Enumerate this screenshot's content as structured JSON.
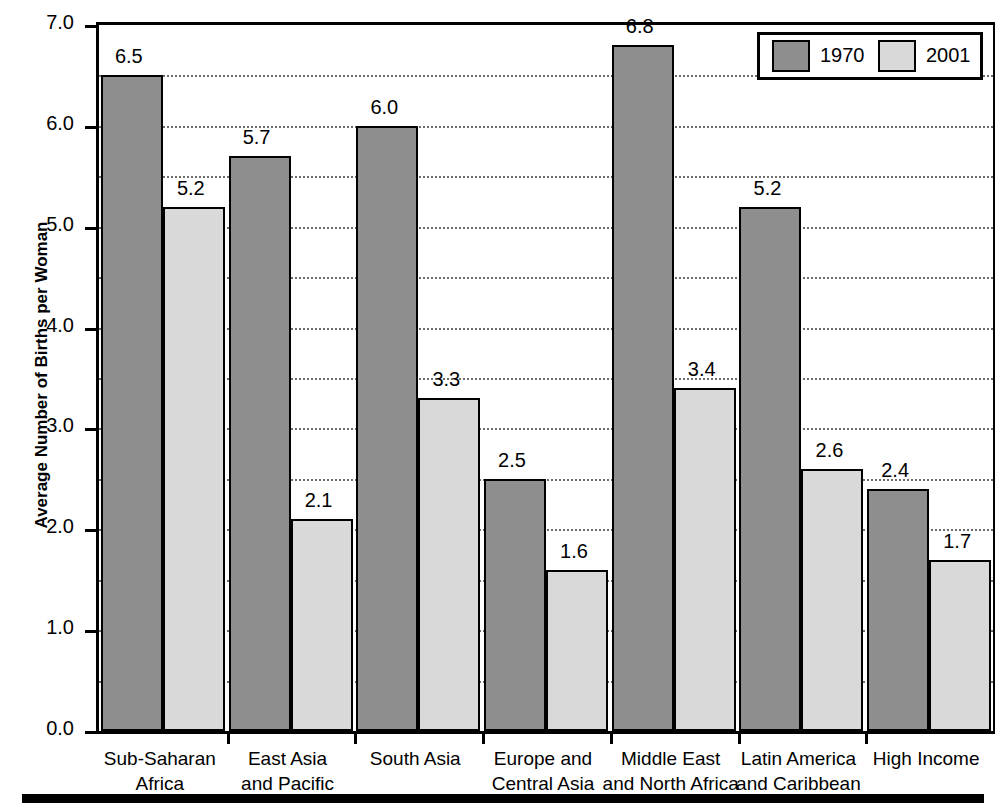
{
  "chart_data": {
    "type": "bar",
    "title": "",
    "xlabel": "",
    "ylabel": "Average Number of Births per Woman",
    "ylim": [
      0.0,
      7.0
    ],
    "ytick_labels": [
      "0.0",
      "1.0",
      "2.0",
      "3.0",
      "4.0",
      "5.0",
      "6.0",
      "7.0"
    ],
    "ytick_values": [
      0.0,
      1.0,
      2.0,
      3.0,
      4.0,
      5.0,
      6.0,
      7.0
    ],
    "grid": "horizontal dotted gridlines every 0.5",
    "legend_position": "top-right inside plot",
    "categories": [
      "Sub-Saharan Africa",
      "East Asia and Pacific",
      "South Asia",
      "Europe and Central Asia",
      "Middle East and North Africa",
      "Latin America and Caribbean",
      "High Income"
    ],
    "category_lines": [
      [
        "Sub-Saharan",
        "Africa"
      ],
      [
        "East Asia",
        "and Pacific"
      ],
      [
        "South Asia",
        ""
      ],
      [
        "Europe and",
        "Central Asia"
      ],
      [
        "Middle East",
        "and North Africa"
      ],
      [
        "Latin America",
        "and Caribbean"
      ],
      [
        "High Income",
        ""
      ]
    ],
    "series": [
      {
        "name": "1970",
        "color": "#8e8e8e",
        "values": [
          6.5,
          5.7,
          6.0,
          2.5,
          6.8,
          5.2,
          2.4
        ],
        "labels": [
          "6.5",
          "5.7",
          "6.0",
          "2.5",
          "6.8",
          "5.2",
          "2.4"
        ]
      },
      {
        "name": "2001",
        "color": "#d9d9d9",
        "values": [
          5.2,
          2.1,
          3.3,
          1.6,
          3.4,
          2.6,
          1.7
        ],
        "labels": [
          "5.2",
          "2.1",
          "3.3",
          "1.6",
          "3.4",
          "2.6",
          "1.7"
        ]
      }
    ]
  },
  "axis": {
    "y_title": "Average Number of Births per Woman",
    "ticks": [
      {
        "label": "7.0",
        "value": 7.0
      },
      {
        "label": "6.0",
        "value": 6.0
      },
      {
        "label": "5.0",
        "value": 5.0
      },
      {
        "label": "4.0",
        "value": 4.0
      },
      {
        "label": "3.0",
        "value": 3.0
      },
      {
        "label": "2.0",
        "value": 2.0
      },
      {
        "label": "1.0",
        "value": 1.0
      },
      {
        "label": "0.0",
        "value": 0.0
      }
    ]
  },
  "legend": {
    "entries": [
      {
        "label": "1970",
        "color": "#8e8e8e"
      },
      {
        "label": "2001",
        "color": "#d9d9d9"
      }
    ]
  }
}
